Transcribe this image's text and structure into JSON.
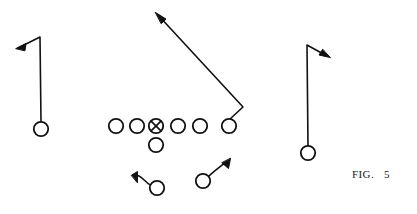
{
  "figure": {
    "label_prefix": "FIG.",
    "label_number": "5",
    "ink_color": "#111111",
    "background_color": "#ffffff",
    "line_width": 1.6,
    "player_radius": 7.2
  },
  "diagram": {
    "type": "football-play",
    "line_of_scrimmage_y": 126,
    "offensive_line": [
      {
        "name": "lineman-1",
        "cx": 116,
        "cy": 126,
        "marker": "circle"
      },
      {
        "name": "lineman-2",
        "cx": 137,
        "cy": 126,
        "marker": "circle"
      },
      {
        "name": "center-with-ball",
        "cx": 156,
        "cy": 126,
        "marker": "circle-x"
      },
      {
        "name": "lineman-4",
        "cx": 178,
        "cy": 126,
        "marker": "circle"
      },
      {
        "name": "lineman-5",
        "cx": 200,
        "cy": 126,
        "marker": "circle"
      },
      {
        "name": "tight-end",
        "cx": 229,
        "cy": 126,
        "marker": "circle"
      }
    ],
    "backfield": [
      {
        "name": "quarterback",
        "cx": 156,
        "cy": 145,
        "marker": "circle"
      },
      {
        "name": "left-back",
        "cx": 157,
        "cy": 188,
        "marker": "circle"
      },
      {
        "name": "right-back",
        "cx": 203,
        "cy": 181,
        "marker": "circle"
      }
    ],
    "receivers": [
      {
        "name": "left-wide-receiver",
        "cx": 41,
        "cy": 129,
        "marker": "circle"
      },
      {
        "name": "right-wide-receiver",
        "cx": 308,
        "cy": 153,
        "marker": "circle"
      }
    ],
    "routes": [
      {
        "name": "left-receiver-route",
        "player": "left-wide-receiver",
        "path": "M 41 122 L 40 37 L 18 48",
        "arrow": {
          "x": 17,
          "y": 48,
          "angle": 205
        },
        "description": "straight upfield then break to the outside left"
      },
      {
        "name": "tight-end-route",
        "player": "tight-end",
        "path": "M 230 119 L 243 107 L 158 15",
        "arrow": {
          "x": 156,
          "y": 13,
          "angle": 227
        },
        "description": "release outside then deep post across the middle"
      },
      {
        "name": "right-receiver-route",
        "player": "right-wide-receiver",
        "path": "M 308 146 L 307 45 L 327 56",
        "arrow": {
          "x": 329,
          "y": 57,
          "angle": 29
        },
        "description": "straight upfield then break to the outside right"
      },
      {
        "name": "left-back-route",
        "player": "left-back",
        "path": "M 150 185 C 144 182 141 175 136 175",
        "arrow": {
          "x": 132,
          "y": 176,
          "angle": 182
        },
        "description": "flare to the left flat"
      },
      {
        "name": "right-back-route",
        "player": "right-back",
        "path": "M 208 176 C 214 170 219 167 226 162",
        "arrow": {
          "x": 230,
          "y": 159,
          "angle": 322
        },
        "description": "angle route to the right"
      }
    ]
  }
}
